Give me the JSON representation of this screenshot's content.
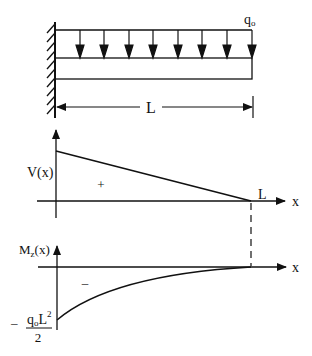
{
  "beam": {
    "load_label": "q",
    "load_sub": "o",
    "length_label": "L",
    "arrow_count": 8
  },
  "shear": {
    "axis_label": "V(x)",
    "sign": "+",
    "end_label": "L",
    "x_label": "x"
  },
  "moment": {
    "axis_label_main": "M",
    "axis_label_sub": "z",
    "axis_label_tail": "(x)",
    "sign": "–",
    "x_label": "x",
    "min_prefix": "–",
    "min_num_q": "q",
    "min_num_sub": "o",
    "min_num_L": "L",
    "min_num_exp": "2",
    "min_den": "2"
  },
  "colors": {
    "ink": "#111111",
    "background": "#ffffff"
  }
}
